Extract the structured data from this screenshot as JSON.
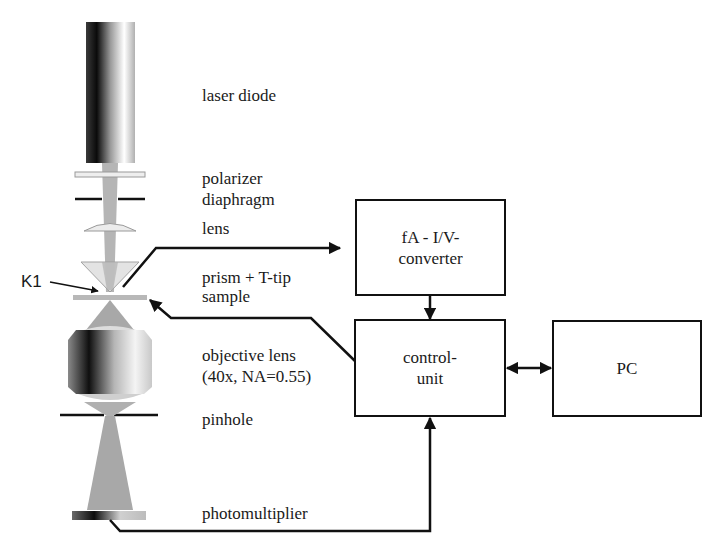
{
  "optics_labels": {
    "laser_diode": "laser diode",
    "polarizer": "polarizer",
    "diaphragm": "diaphragm",
    "lens": "lens",
    "prism": "prism + T-tip",
    "sample": "sample",
    "objective_line1": "objective lens",
    "objective_line2": "(40x, NA=0.55)",
    "pinhole": "pinhole",
    "photomultiplier": "photomultiplier",
    "k1": "K1"
  },
  "blocks": {
    "converter": {
      "line1": "fA - I/V-",
      "line2": "converter"
    },
    "control_unit": {
      "line1": "control-",
      "line2": "unit"
    },
    "pc": {
      "line1": "PC"
    }
  },
  "colors": {
    "line": "#111111",
    "beam": "#a8a8a8",
    "element_light": "#d8d8d8"
  }
}
